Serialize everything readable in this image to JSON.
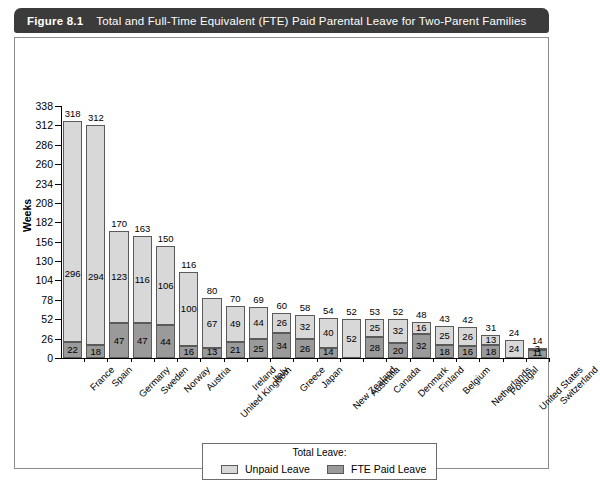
{
  "figure": {
    "number": "Figure 8.1",
    "title": "Total and Full-Time Equivalent (FTE) Paid Parental Leave for Two-Parent Families"
  },
  "colors": {
    "title_bar": "#3b3b3b",
    "unpaid": "#d8d8d8",
    "paid": "#9a9a9a",
    "border": "#5a5a5a",
    "text": "#000000"
  },
  "legend": {
    "title": "Total Leave:",
    "items": [
      {
        "label": "Unpaid Leave",
        "color": "#d8d8d8"
      },
      {
        "label": "FTE Paid Leave",
        "color": "#9a9a9a"
      }
    ]
  },
  "chart_data": {
    "type": "bar",
    "subtype": "stacked",
    "title": "Total and Full-Time Equivalent (FTE) Paid Parental Leave for Two-Parent Families",
    "xlabel": "",
    "ylabel": "Weeks",
    "ylim": [
      0,
      338
    ],
    "yticks": [
      0,
      26,
      52,
      78,
      104,
      130,
      156,
      182,
      208,
      234,
      260,
      286,
      312,
      338
    ],
    "grid": false,
    "legend_position": "bottom-center",
    "categories": [
      "France",
      "Spain",
      "Germany",
      "Sweden",
      "Norway",
      "Austria",
      "United Kingdom",
      "Ireland",
      "Italy",
      "Greece",
      "Japan",
      "New Zealand",
      "Australia",
      "Canada",
      "Denmark",
      "Finland",
      "Belgium",
      "Netherlands",
      "Portugal",
      "United States",
      "Switzerland"
    ],
    "series": [
      {
        "name": "Unpaid Leave",
        "color": "#d8d8d8",
        "values": [
          296,
          294,
          123,
          116,
          106,
          100,
          67,
          49,
          44,
          26,
          32,
          40,
          52,
          25,
          32,
          16,
          25,
          26,
          13,
          24,
          3
        ]
      },
      {
        "name": "FTE Paid Leave",
        "color": "#9a9a9a",
        "values": [
          22,
          18,
          47,
          47,
          44,
          16,
          13,
          21,
          25,
          34,
          26,
          14,
          0,
          28,
          20,
          32,
          18,
          16,
          18,
          0,
          11
        ]
      }
    ],
    "totals": [
      318,
      312,
      170,
      163,
      150,
      116,
      80,
      70,
      69,
      60,
      58,
      54,
      52,
      53,
      52,
      48,
      43,
      42,
      31,
      24,
      14
    ]
  }
}
